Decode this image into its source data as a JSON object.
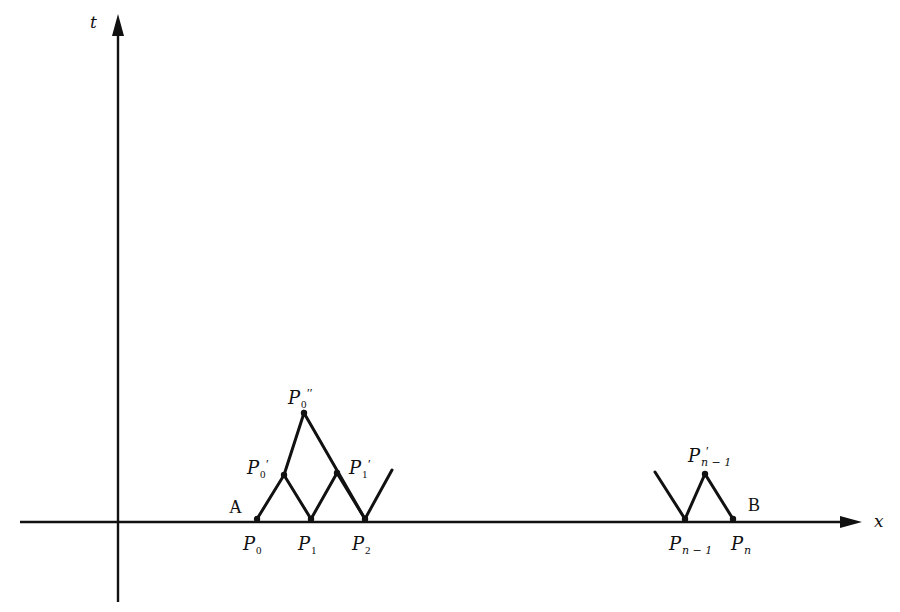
{
  "diagram": {
    "axes": {
      "x_label": "x",
      "t_label": "t"
    },
    "endpoints": {
      "left": "A",
      "right": "B"
    },
    "points": {
      "P0": {
        "base": "P",
        "sub": "0",
        "prime": ""
      },
      "P1": {
        "base": "P",
        "sub": "1",
        "prime": ""
      },
      "P2": {
        "base": "P",
        "sub": "2",
        "prime": ""
      },
      "P0p": {
        "base": "P",
        "sub": "0",
        "prime": "′"
      },
      "P1p": {
        "base": "P",
        "sub": "1",
        "prime": "′"
      },
      "P0pp": {
        "base": "P",
        "sub": "0",
        "prime": "′′"
      },
      "Pn1": {
        "base": "P",
        "sub": "n − 1",
        "prime": ""
      },
      "Pn": {
        "base": "P",
        "sub": "n",
        "prime": ""
      },
      "Pn1p": {
        "base": "P",
        "sub": "n − 1",
        "prime": "′"
      }
    },
    "line_color": "#111111",
    "background": "#ffffff"
  }
}
